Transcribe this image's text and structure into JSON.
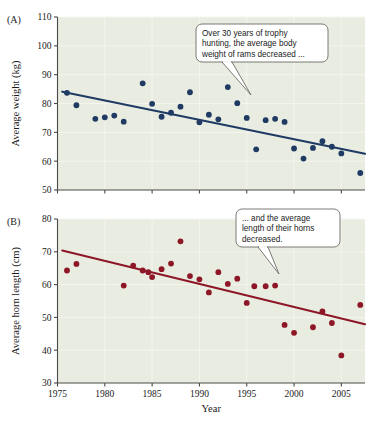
{
  "figure": {
    "panels": [
      {
        "id": "A",
        "label": "(A)",
        "ylabel": "Average horn length placeholder",
        "callout": {
          "lines": [
            "Over 30 years of trophy",
            "hunting, the average body",
            "weight of rams decreased ..."
          ]
        }
      },
      {
        "id": "B",
        "label": "(B)",
        "callout": {
          "lines": [
            "... and the average",
            "length of their horns",
            "decreased."
          ]
        }
      }
    ],
    "xlabel": "Year",
    "colors": {
      "plot_background": "#e9ece1",
      "panel_a_marker": "#1f3a63",
      "panel_a_trend": "#1f3a63",
      "panel_b_marker": "#8d1726",
      "panel_b_trend": "#8d1726",
      "gridline": "#f4f6ee",
      "axis": "#4a4a46",
      "callout_border": "#6b6b66",
      "text": "#1a1a1a"
    }
  },
  "chart_data": [
    {
      "type": "scatter",
      "panel": "A",
      "title": "",
      "xlabel": "Year",
      "ylabel": "Average weight (kg)",
      "xlim": [
        1975,
        2007.5
      ],
      "ylim": [
        50,
        110
      ],
      "xticks": [
        1975,
        1980,
        1985,
        1990,
        1995,
        2000,
        2005
      ],
      "yticks": [
        50,
        60,
        70,
        80,
        90,
        100,
        110
      ],
      "grid": true,
      "legend": "none",
      "points": [
        {
          "x": 1976,
          "y": 83.7
        },
        {
          "x": 1977,
          "y": 79.4
        },
        {
          "x": 1979,
          "y": 74.7
        },
        {
          "x": 1980,
          "y": 75.2
        },
        {
          "x": 1981,
          "y": 75.8
        },
        {
          "x": 1982,
          "y": 73.7
        },
        {
          "x": 1984,
          "y": 87.0
        },
        {
          "x": 1985,
          "y": 79.9
        },
        {
          "x": 1986,
          "y": 75.4
        },
        {
          "x": 1987,
          "y": 76.8
        },
        {
          "x": 1988,
          "y": 78.9
        },
        {
          "x": 1989,
          "y": 83.9
        },
        {
          "x": 1990,
          "y": 73.5
        },
        {
          "x": 1991,
          "y": 76.1
        },
        {
          "x": 1992,
          "y": 74.5
        },
        {
          "x": 1993,
          "y": 85.7
        },
        {
          "x": 1994,
          "y": 80.1
        },
        {
          "x": 1995,
          "y": 75.0
        },
        {
          "x": 1996,
          "y": 64.1
        },
        {
          "x": 1997,
          "y": 74.2
        },
        {
          "x": 1998,
          "y": 74.7
        },
        {
          "x": 1999,
          "y": 73.6
        },
        {
          "x": 2000,
          "y": 64.4
        },
        {
          "x": 2001,
          "y": 60.9
        },
        {
          "x": 2002,
          "y": 64.6
        },
        {
          "x": 2003,
          "y": 66.9
        },
        {
          "x": 2004,
          "y": 65.0
        },
        {
          "x": 2005,
          "y": 62.7
        },
        {
          "x": 2007,
          "y": 55.9
        }
      ],
      "trendline": {
        "x1": 1975.5,
        "y1": 84.1,
        "x2": 2007.5,
        "y2": 62.6
      }
    },
    {
      "type": "scatter",
      "panel": "B",
      "title": "",
      "xlabel": "Year",
      "ylabel": "Average horn length (cm)",
      "xlim": [
        1975,
        2007.5
      ],
      "ylim": [
        30,
        80
      ],
      "xticks": [
        1975,
        1980,
        1985,
        1990,
        1995,
        2000,
        2005
      ],
      "yticks": [
        30,
        40,
        50,
        60,
        70,
        80
      ],
      "grid": true,
      "legend": "none",
      "points": [
        {
          "x": 1976,
          "y": 64.3
        },
        {
          "x": 1977,
          "y": 66.3
        },
        {
          "x": 1982,
          "y": 59.7
        },
        {
          "x": 1983,
          "y": 65.8
        },
        {
          "x": 1984,
          "y": 64.3
        },
        {
          "x": 1984.6,
          "y": 63.8
        },
        {
          "x": 1985,
          "y": 62.3
        },
        {
          "x": 1986,
          "y": 64.7
        },
        {
          "x": 1987,
          "y": 66.4
        },
        {
          "x": 1988,
          "y": 73.2
        },
        {
          "x": 1989,
          "y": 62.6
        },
        {
          "x": 1990,
          "y": 61.6
        },
        {
          "x": 1991,
          "y": 57.6
        },
        {
          "x": 1992,
          "y": 63.8
        },
        {
          "x": 1993,
          "y": 60.2
        },
        {
          "x": 1994,
          "y": 61.8
        },
        {
          "x": 1995,
          "y": 54.4
        },
        {
          "x": 1995.8,
          "y": 59.5
        },
        {
          "x": 1997,
          "y": 59.5
        },
        {
          "x": 1998,
          "y": 59.7
        },
        {
          "x": 1999,
          "y": 47.7
        },
        {
          "x": 2000,
          "y": 45.3
        },
        {
          "x": 2002,
          "y": 47.0
        },
        {
          "x": 2003,
          "y": 51.8
        },
        {
          "x": 2004,
          "y": 48.3
        },
        {
          "x": 2005,
          "y": 38.4
        },
        {
          "x": 2007,
          "y": 53.8
        }
      ],
      "trendline": {
        "x1": 1975.5,
        "y1": 70.4,
        "x2": 2007.5,
        "y2": 47.9
      }
    }
  ]
}
